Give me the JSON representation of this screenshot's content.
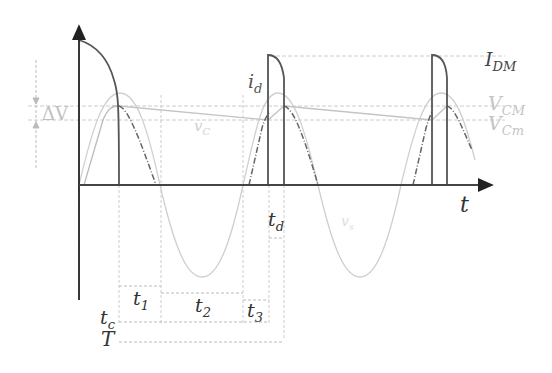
{
  "diagram": {
    "colors": {
      "dark": "#555555",
      "grid": "#c8c8c8",
      "light": "#cfcfcf",
      "label_dark": "#444444",
      "label_light": "#bbbbbb"
    },
    "axis": {
      "x_label": "t"
    },
    "labels": {
      "i_d": "i",
      "i_d_sub": "d",
      "I_DM": "I",
      "I_DM_sub": "DM",
      "V_CM": "V",
      "V_CM_sub": "CM",
      "V_Cm": "V",
      "V_Cm_sub": "Cm",
      "delta_V": "ΔV",
      "v_C": "v",
      "v_C_sub": "C",
      "v_s": "v",
      "v_s_sub": "s"
    },
    "intervals": {
      "t1": "t",
      "t1_sub": "1",
      "t2": "t",
      "t2_sub": "2",
      "t3": "t",
      "t3_sub": "3",
      "tc": "t",
      "tc_sub": "c",
      "td": "t",
      "td_sub": "d",
      "T": "T"
    }
  }
}
